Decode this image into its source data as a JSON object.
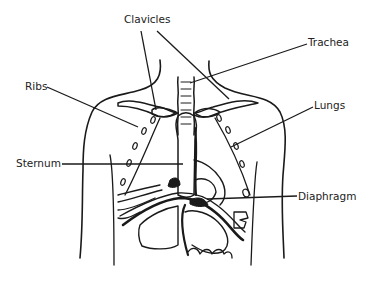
{
  "diagram": {
    "colors": {
      "ink": "#1a1a1a",
      "text": "#222222",
      "background": "#ffffff"
    },
    "labels": [
      {
        "id": "clavicles",
        "text": "Clavicles",
        "x": 124,
        "y": 14
      },
      {
        "id": "trachea",
        "text": "Trachea",
        "x": 308,
        "y": 37
      },
      {
        "id": "ribs",
        "text": "Ribs",
        "x": 25,
        "y": 81
      },
      {
        "id": "lungs",
        "text": "Lungs",
        "x": 314,
        "y": 100
      },
      {
        "id": "sternum",
        "text": "Sternum",
        "x": 16,
        "y": 156
      },
      {
        "id": "diaphragm",
        "text": "Diaphragm",
        "x": 298,
        "y": 191
      }
    ]
  }
}
